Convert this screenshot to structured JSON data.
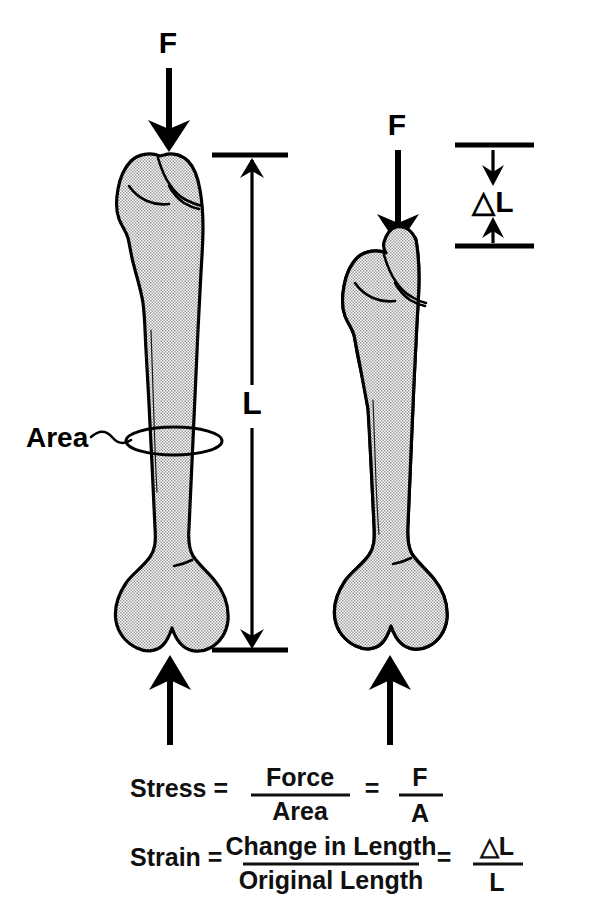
{
  "figure": {
    "background_color": "#ffffff",
    "ink_color": "#000000",
    "bone_fill_color": "#c8c8c8"
  },
  "left_specimen": {
    "name": "unloaded-bone",
    "force_label": "F",
    "length_label": "L",
    "area_label": "Area",
    "top_arrow_direction": "down",
    "bottom_arrow_direction": "up"
  },
  "right_specimen": {
    "name": "loaded-bone",
    "force_label": "F",
    "deformation_label": "△L",
    "top_arrow_direction": "down",
    "bottom_arrow_direction": "up"
  },
  "formulas": [
    {
      "id": "stress",
      "name": "Stress",
      "lhs": "Stress =",
      "numerator": "Force",
      "denominator": "Area",
      "equals": "=",
      "result_numerator": "F",
      "result_denominator": "A"
    },
    {
      "id": "strain",
      "name": "Strain",
      "lhs": "Strain =",
      "numerator": "Change in Length",
      "denominator": "Original Length",
      "equals": "=",
      "result_numerator": "△L",
      "result_denominator": "L"
    }
  ]
}
